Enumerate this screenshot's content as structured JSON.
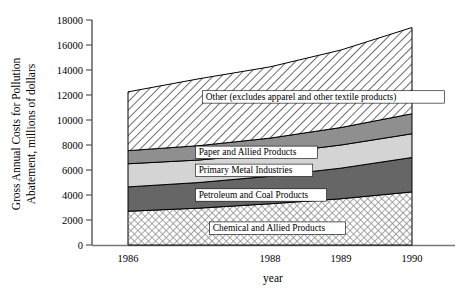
{
  "chart_data": {
    "type": "area",
    "title": "",
    "subtitle": "",
    "xlabel": "year",
    "ylabel": "Gross Annual Costs for Pollution Abatement, millions of dollars",
    "ylabel_line1": "Gross Annual Costs for Pollution",
    "ylabel_line2": "Abatement, millions of dollars",
    "x": [
      1986,
      1987,
      1988,
      1989,
      1990
    ],
    "categories": [
      "1986",
      "1987",
      "1988",
      "1989",
      "1990"
    ],
    "xtick_labels": [
      "1986",
      "1988",
      "1989",
      "1990"
    ],
    "xtick_values": [
      1986,
      1988,
      1989,
      1990
    ],
    "ytick_labels": [
      "0",
      "2000",
      "4000",
      "6000",
      "8000",
      "10000",
      "12000",
      "14000",
      "16000",
      "18000"
    ],
    "ytick_values": [
      0,
      2000,
      4000,
      6000,
      8000,
      10000,
      12000,
      14000,
      16000,
      18000
    ],
    "ylim": [
      0,
      18000
    ],
    "xlim": [
      1986,
      1990
    ],
    "grid": false,
    "legend": "inline-band-labels",
    "stacked": true,
    "series": [
      {
        "name": "Chemical and Allied Products",
        "label": "Chemical and Allied Products",
        "fill": "cross-hatch",
        "color": "#ffffff",
        "values": [
          2700,
          2950,
          3300,
          3700,
          4250
        ]
      },
      {
        "name": "Petroleum and Coal Products",
        "label": "Petroleum and Coal Products",
        "fill": "solid-dark-gray",
        "color": "#666666",
        "values": [
          1950,
          2050,
          2200,
          2450,
          2750
        ]
      },
      {
        "name": "Primary Metal Industries",
        "label": "Primary Metal Industries",
        "fill": "solid-light-gray",
        "color": "#d4d4d4",
        "values": [
          1850,
          1800,
          1800,
          1850,
          1900
        ]
      },
      {
        "name": "Paper and Allied Products",
        "label": "Paper and Allied Products",
        "fill": "solid-medium-gray",
        "color": "#8f8f8f",
        "values": [
          1050,
          1150,
          1250,
          1400,
          1600
        ]
      },
      {
        "name": "Other (excludes apparel and other textile products)",
        "label": "Other (excludes apparel and other textile products)",
        "fill": "diagonal-hatch",
        "color": "#ffffff",
        "values": [
          4700,
          5350,
          5700,
          6200,
          6900
        ]
      }
    ],
    "cumulative_tops": {
      "chemical": [
        2700,
        2950,
        3300,
        3700,
        4250
      ],
      "petroleum": [
        4650,
        5000,
        5500,
        6150,
        7000
      ],
      "primary_metal": [
        6500,
        6800,
        7300,
        8000,
        8900
      ],
      "paper": [
        7550,
        7950,
        8550,
        9400,
        10500
      ],
      "total": [
        12250,
        13300,
        14250,
        15600,
        17400
      ]
    }
  }
}
